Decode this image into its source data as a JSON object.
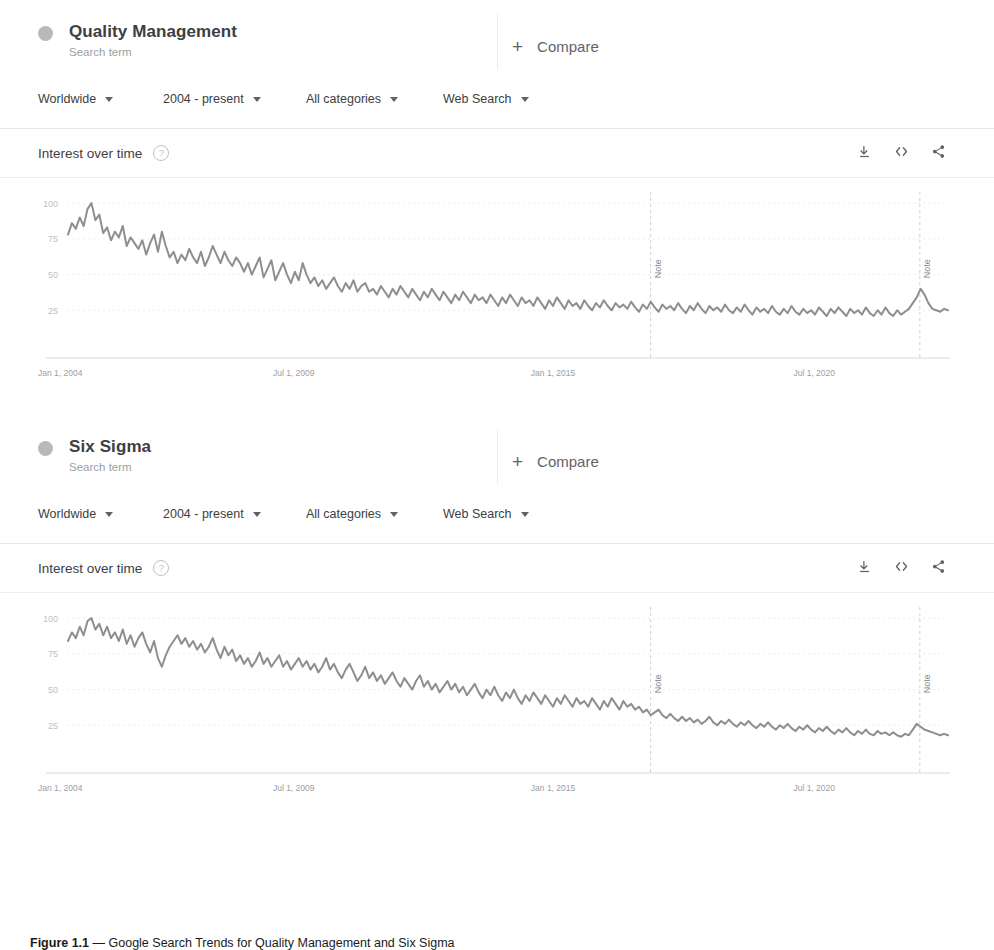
{
  "accent_color": "#9e9e9e",
  "line_color": "#8e8e8e",
  "sections": [
    {
      "term": "Quality Management",
      "term_type": "Search term",
      "compare_label": "Compare",
      "compare_icon": "plus-icon",
      "filters": [
        {
          "name": "region",
          "value": "Worldwide"
        },
        {
          "name": "time-range",
          "value": "2004 - present"
        },
        {
          "name": "category",
          "value": "All categories"
        },
        {
          "name": "search-type",
          "value": "Web Search"
        }
      ],
      "panel_title": "Interest over time",
      "help_glyph": "?",
      "tools": [
        {
          "name": "download-icon",
          "label": "Download"
        },
        {
          "name": "embed-icon",
          "label": "Embed"
        },
        {
          "name": "share-icon",
          "label": "Share"
        }
      ]
    },
    {
      "term": "Six Sigma",
      "term_type": "Search term",
      "compare_label": "Compare",
      "compare_icon": "plus-icon",
      "filters": [
        {
          "name": "region",
          "value": "Worldwide"
        },
        {
          "name": "time-range",
          "value": "2004 - present"
        },
        {
          "name": "category",
          "value": "All categories"
        },
        {
          "name": "search-type",
          "value": "Web Search"
        }
      ],
      "panel_title": "Interest over time",
      "help_glyph": "?",
      "tools": [
        {
          "name": "download-icon",
          "label": "Download"
        },
        {
          "name": "embed-icon",
          "label": "Embed"
        },
        {
          "name": "share-icon",
          "label": "Share"
        }
      ]
    }
  ],
  "caption": {
    "prefix": "Figure 1.1",
    "dash": "—",
    "text": "Google Search Trends for Quality Management and Six Sigma"
  },
  "chart_data": [
    {
      "type": "line",
      "title": "Interest over time",
      "series_name": "Quality Management",
      "xlabel": "",
      "ylabel": "",
      "ylim": [
        0,
        105
      ],
      "yticks": [
        25,
        50,
        75,
        100
      ],
      "xticks": [
        "Jan 1, 2004",
        "Jul 1, 2009",
        "Jan 1, 2015",
        "Jul 1, 2020"
      ],
      "xtick_positions": [
        0,
        0.281,
        0.566,
        0.853
      ],
      "grid": true,
      "legend": "none",
      "annotations": [
        {
          "label": "Note",
          "x": 0.662
        },
        {
          "label": "Note",
          "x": 0.968
        }
      ],
      "values": [
        78,
        86,
        82,
        90,
        84,
        96,
        100,
        88,
        92,
        79,
        83,
        74,
        80,
        76,
        84,
        70,
        76,
        72,
        68,
        74,
        64,
        72,
        78,
        66,
        80,
        70,
        62,
        66,
        58,
        64,
        60,
        68,
        62,
        58,
        66,
        56,
        62,
        70,
        64,
        58,
        66,
        60,
        56,
        62,
        58,
        52,
        58,
        50,
        56,
        62,
        48,
        54,
        60,
        46,
        52,
        58,
        50,
        44,
        52,
        46,
        58,
        50,
        44,
        48,
        42,
        46,
        40,
        44,
        48,
        42,
        38,
        44,
        40,
        46,
        38,
        42,
        44,
        38,
        40,
        36,
        42,
        38,
        34,
        40,
        36,
        42,
        38,
        34,
        40,
        36,
        32,
        38,
        34,
        40,
        36,
        32,
        38,
        34,
        30,
        36,
        32,
        38,
        34,
        30,
        36,
        32,
        34,
        30,
        36,
        32,
        28,
        34,
        30,
        36,
        32,
        28,
        34,
        30,
        32,
        28,
        34,
        30,
        26,
        32,
        28,
        34,
        30,
        26,
        32,
        28,
        30,
        26,
        32,
        28,
        25,
        30,
        27,
        32,
        28,
        25,
        30,
        27,
        29,
        26,
        31,
        27,
        24,
        29,
        26,
        31,
        27,
        24,
        29,
        26,
        28,
        25,
        30,
        26,
        23,
        28,
        25,
        30,
        26,
        23,
        28,
        25,
        27,
        24,
        29,
        25,
        23,
        27,
        24,
        29,
        25,
        22,
        27,
        24,
        26,
        23,
        28,
        24,
        22,
        26,
        23,
        28,
        24,
        22,
        26,
        23,
        25,
        22,
        27,
        24,
        21,
        26,
        23,
        27,
        24,
        21,
        26,
        23,
        25,
        22,
        27,
        23,
        21,
        25,
        22,
        27,
        23,
        21,
        25,
        22,
        24,
        26,
        30,
        34,
        40,
        36,
        30,
        26,
        25,
        24,
        26,
        25
      ]
    },
    {
      "type": "line",
      "title": "Interest over time",
      "series_name": "Six Sigma",
      "xlabel": "",
      "ylabel": "",
      "ylim": [
        0,
        105
      ],
      "yticks": [
        25,
        50,
        75,
        100
      ],
      "xticks": [
        "Jan 1, 2004",
        "Jul 1, 2009",
        "Jan 1, 2015",
        "Jul 1, 2020"
      ],
      "xtick_positions": [
        0,
        0.281,
        0.566,
        0.853
      ],
      "grid": true,
      "legend": "none",
      "annotations": [
        {
          "label": "Note",
          "x": 0.662
        },
        {
          "label": "Note",
          "x": 0.968
        }
      ],
      "values": [
        84,
        90,
        86,
        94,
        88,
        98,
        100,
        92,
        96,
        88,
        94,
        86,
        90,
        84,
        92,
        82,
        88,
        80,
        86,
        90,
        82,
        76,
        84,
        72,
        66,
        74,
        80,
        84,
        88,
        82,
        86,
        80,
        84,
        78,
        82,
        76,
        80,
        86,
        78,
        72,
        80,
        74,
        78,
        70,
        74,
        68,
        72,
        66,
        70,
        76,
        68,
        72,
        66,
        70,
        74,
        66,
        70,
        64,
        68,
        72,
        66,
        70,
        64,
        68,
        62,
        66,
        72,
        64,
        68,
        62,
        58,
        64,
        68,
        62,
        56,
        60,
        66,
        58,
        62,
        56,
        60,
        54,
        58,
        62,
        56,
        52,
        58,
        54,
        50,
        56,
        60,
        52,
        56,
        50,
        54,
        48,
        52,
        56,
        50,
        54,
        48,
        52,
        46,
        50,
        54,
        48,
        44,
        50,
        46,
        52,
        46,
        42,
        48,
        44,
        50,
        44,
        40,
        46,
        42,
        48,
        44,
        40,
        46,
        42,
        38,
        44,
        40,
        46,
        42,
        38,
        44,
        40,
        42,
        38,
        44,
        40,
        36,
        42,
        38,
        44,
        40,
        36,
        42,
        38,
        40,
        36,
        38,
        34,
        36,
        32,
        34,
        36,
        32,
        30,
        33,
        30,
        28,
        31,
        28,
        30,
        27,
        29,
        26,
        28,
        31,
        27,
        25,
        28,
        26,
        29,
        26,
        24,
        27,
        25,
        28,
        25,
        23,
        26,
        24,
        27,
        24,
        22,
        25,
        23,
        26,
        23,
        21,
        24,
        22,
        25,
        22,
        20,
        23,
        21,
        24,
        21,
        19,
        22,
        20,
        23,
        20,
        18,
        21,
        19,
        22,
        19,
        18,
        21,
        19,
        20,
        18,
        20,
        18,
        17,
        19,
        18,
        22,
        26,
        24,
        22,
        21,
        20,
        19,
        18,
        19,
        18
      ]
    }
  ]
}
